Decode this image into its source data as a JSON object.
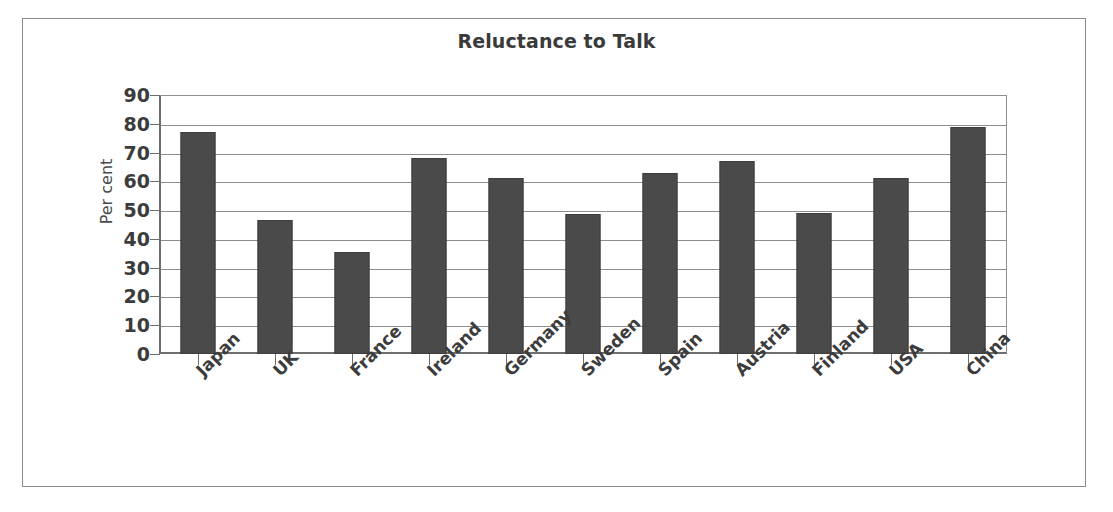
{
  "chart_data": {
    "type": "bar",
    "title": "Reluctance to Talk",
    "xlabel": "",
    "ylabel": "Per cent",
    "ylim": [
      0,
      90
    ],
    "ytick_step": 10,
    "yticks": [
      90,
      80,
      70,
      60,
      50,
      40,
      30,
      20,
      10,
      0
    ],
    "grid": true,
    "legend": null,
    "categories": [
      "Japan",
      "UK",
      "France",
      "Ireland",
      "Germany",
      "Sweden",
      "Spain",
      "Austria",
      "Finland",
      "USA",
      "China"
    ],
    "values": [
      77,
      46.5,
      35.5,
      68,
      61,
      48.5,
      63,
      67,
      49,
      61,
      79
    ],
    "series": [
      {
        "name": "Reluctance to Talk",
        "values": [
          77,
          46.5,
          35.5,
          68,
          61,
          48.5,
          63,
          67,
          49,
          61,
          79
        ]
      }
    ]
  },
  "colors": {
    "bar_fill": "#4a4a4a",
    "bar_border": "#3d3d3d",
    "grid": "#8d8d8d",
    "axis": "#6e6e6e",
    "text": "#3c3c3c",
    "title_text": "#3a3a3a",
    "frame": "#8a8a8a",
    "background": "#ffffff"
  }
}
